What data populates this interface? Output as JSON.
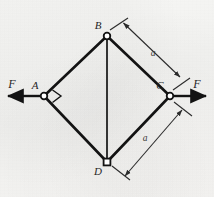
{
  "figure": {
    "background_color": "#f4f4f2",
    "ink_color": "#131313",
    "dimension_color": "#2b2b2b"
  },
  "nodes": [
    {
      "id": "A",
      "label": "A",
      "x": 44,
      "y": 96,
      "marker": "circle-pin",
      "label_dx": -9,
      "label_dy": -7
    },
    {
      "id": "B",
      "label": "B",
      "x": 107,
      "y": 36,
      "marker": "circle-pin",
      "label_dx": -9,
      "label_dy": -7
    },
    {
      "id": "C",
      "label": "C",
      "x": 170,
      "y": 96,
      "marker": "circle-pin",
      "label_dx": -10,
      "label_dy": -7
    },
    {
      "id": "D",
      "label": "D",
      "x": 107,
      "y": 162,
      "marker": "square-pin",
      "label_dx": -9,
      "label_dy": 13
    }
  ],
  "members": [
    {
      "from": "A",
      "to": "B"
    },
    {
      "from": "B",
      "to": "C"
    },
    {
      "from": "C",
      "to": "D"
    },
    {
      "from": "D",
      "to": "A"
    },
    {
      "from": "B",
      "to": "D"
    }
  ],
  "angle_marker": {
    "at_node": "A",
    "type": "right-angle-square",
    "label": ""
  },
  "forces": [
    {
      "id": "F-left",
      "label": "F",
      "applied_at": "A",
      "direction": "left",
      "label_x": 12,
      "label_y": 86
    },
    {
      "id": "F-right",
      "label": "F",
      "applied_at": "C",
      "direction": "right",
      "label_x": 196,
      "label_y": 86
    }
  ],
  "dimensions": [
    {
      "id": "dim-bc",
      "label": "a",
      "from": "B",
      "to": "C",
      "label_x": 153,
      "label_y": 56
    },
    {
      "id": "dim-dc",
      "label": "a",
      "from": "D",
      "to": "C",
      "label_x": 145,
      "label_y": 140
    }
  ]
}
